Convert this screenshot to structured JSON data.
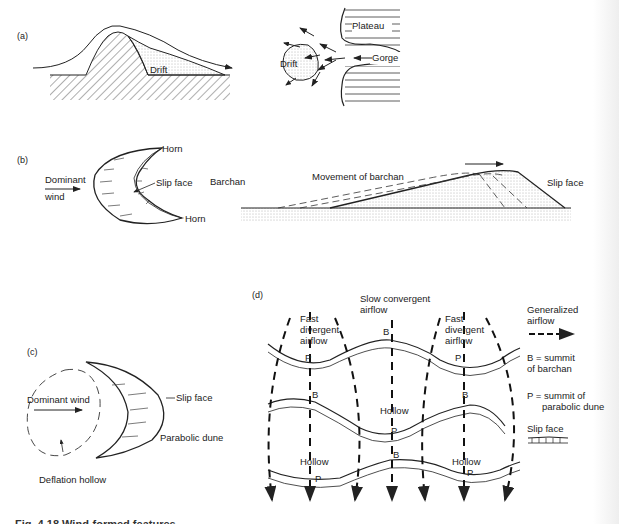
{
  "figure": {
    "caption": "Fig. 4.18  Wind-formed features",
    "panels": {
      "a": {
        "label": "(a)",
        "drift_label_profile": "Drift",
        "drift_label_plan": "Drift",
        "plateau_label": "Plateau",
        "gorge_label": "Gorge"
      },
      "b": {
        "label": "(b)",
        "horn_top": "Horn",
        "horn_bottom": "Horn",
        "slip_face": "Slip face",
        "dominant": "Dominant",
        "wind": "wind",
        "barchan": "Barchan",
        "movement": "Movement of barchan",
        "slip_face_profile": "Slip face"
      },
      "c": {
        "label": "(c)",
        "dominant_wind": "Dominant wind",
        "slip_face": "Slip face",
        "parabolic_dune": "Parabolic dune",
        "deflation_hollow": "Deflation hollow"
      },
      "d": {
        "label": "(d)",
        "slow_convergent_1": "Slow convergent",
        "slow_convergent_2": "airflow",
        "fast_divergent_left": [
          "Fast",
          "divergent",
          "airflow"
        ],
        "fast_divergent_right": [
          "Fast",
          "divergent",
          "airflow"
        ],
        "summit_b": "B",
        "summit_p": "P",
        "hollow": "Hollow",
        "legend": {
          "generalized_1": "Generalized",
          "generalized_2": "airflow",
          "b_def_1": "B = summit",
          "b_def_2": "of barchan",
          "p_def_1": "P = summit of",
          "p_def_2": "parabolic dune",
          "slip_face": "Slip face"
        }
      }
    }
  }
}
